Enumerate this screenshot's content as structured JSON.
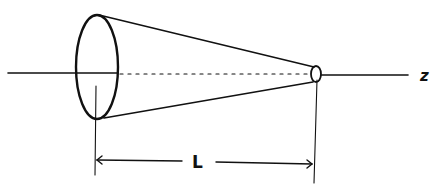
{
  "diagram": {
    "type": "truncated-cone-schematic",
    "labels": {
      "length": "L",
      "axis": "z"
    },
    "colors": {
      "ink": "#111111",
      "background": "#ffffff"
    },
    "elements": {
      "axis": {
        "y": 73,
        "x_start": 8,
        "x_end": 408
      },
      "base_ellipse": {
        "cx": 97,
        "cy": 67,
        "rx": 21,
        "ry": 52
      },
      "apex_ellipse": {
        "cx": 316,
        "cy": 74,
        "rx": 5,
        "ry": 8
      },
      "dimension": {
        "y": 162,
        "x_left": 96,
        "x_right": 314
      }
    }
  }
}
